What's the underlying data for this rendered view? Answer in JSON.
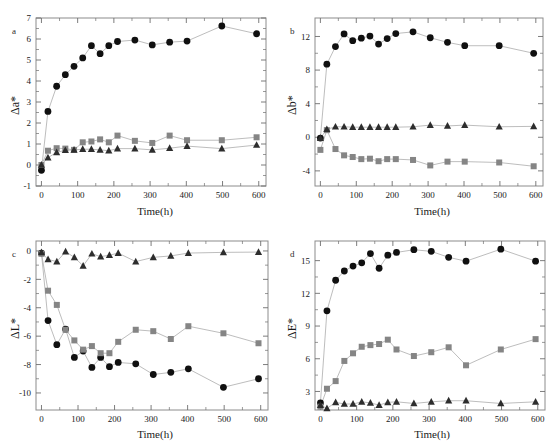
{
  "figure": {
    "title": "",
    "panel_count": 4
  },
  "chart_data": [
    {
      "panel": "a",
      "type": "line",
      "title": "a",
      "xlabel": "Time(h)",
      "ylabel": "Δa*",
      "xlim": [
        -15,
        620
      ],
      "ylim": [
        -1,
        7
      ],
      "xticks": [
        0,
        100,
        200,
        300,
        400,
        500,
        600
      ],
      "xticklabels": [
        "0",
        "100",
        "200",
        "300",
        "400",
        "500",
        "600"
      ],
      "yticks": [
        -1,
        0,
        1,
        2,
        3,
        4,
        5,
        6,
        7
      ],
      "yticklabels": [
        "-1",
        "0",
        "1",
        "2",
        "3",
        "4",
        "5",
        "6",
        "7"
      ],
      "grid": false,
      "legend": "none",
      "series": [
        {
          "name": "circles",
          "marker": "circle",
          "color": "#101010",
          "x": [
            0,
            18,
            42,
            66,
            90,
            114,
            138,
            162,
            186,
            210,
            258,
            306,
            354,
            402,
            498,
            594
          ],
          "y": [
            -0.25,
            2.55,
            3.75,
            4.3,
            4.7,
            5.1,
            5.68,
            5.3,
            5.68,
            5.88,
            5.95,
            5.72,
            5.85,
            5.9,
            6.62,
            6.25
          ]
        },
        {
          "name": "squares",
          "marker": "square",
          "color": "#858585",
          "x": [
            0,
            18,
            42,
            66,
            90,
            114,
            138,
            162,
            186,
            210,
            258,
            306,
            354,
            402,
            498,
            594
          ],
          "y": [
            0.0,
            0.68,
            0.8,
            0.78,
            0.72,
            1.08,
            1.12,
            1.22,
            1.08,
            1.4,
            1.15,
            1.05,
            1.4,
            1.18,
            1.18,
            1.32
          ]
        },
        {
          "name": "triangles",
          "marker": "triangle",
          "color": "#2d2d2d",
          "x": [
            0,
            18,
            42,
            66,
            90,
            114,
            138,
            162,
            186,
            210,
            258,
            306,
            354,
            402,
            498,
            594
          ],
          "y": [
            0.0,
            0.35,
            0.6,
            0.7,
            0.72,
            0.75,
            0.75,
            0.72,
            0.68,
            0.78,
            0.78,
            0.72,
            0.8,
            0.9,
            0.78,
            0.95
          ]
        }
      ]
    },
    {
      "panel": "b",
      "type": "line",
      "title": "b",
      "xlabel": "Time(h)",
      "ylabel": "Δb*",
      "xlim": [
        -15,
        620
      ],
      "ylim": [
        -5.8,
        14.2
      ],
      "xticks": [
        0,
        100,
        200,
        300,
        400,
        500,
        600
      ],
      "xticklabels": [
        "0",
        "100",
        "200",
        "300",
        "400",
        "500",
        "600"
      ],
      "yticks": [
        -4,
        0,
        4,
        8,
        12
      ],
      "yticklabels": [
        "-4",
        "0",
        "4",
        "8",
        "12"
      ],
      "grid": false,
      "legend": "none",
      "series": [
        {
          "name": "circles",
          "marker": "circle",
          "color": "#101010",
          "x": [
            0,
            18,
            42,
            66,
            90,
            114,
            138,
            162,
            186,
            210,
            258,
            306,
            354,
            402,
            498,
            594
          ],
          "y": [
            -0.1,
            8.7,
            10.8,
            12.3,
            11.5,
            11.8,
            12.05,
            11.1,
            11.75,
            12.35,
            12.55,
            11.85,
            11.3,
            10.9,
            10.9,
            10.0
          ]
        },
        {
          "name": "squares",
          "marker": "square",
          "color": "#858585",
          "x": [
            0,
            18,
            42,
            66,
            90,
            114,
            138,
            162,
            186,
            210,
            258,
            306,
            354,
            402,
            498,
            594
          ],
          "y": [
            -1.5,
            0.85,
            -1.4,
            -2.15,
            -2.35,
            -2.6,
            -2.55,
            -2.85,
            -2.6,
            -2.6,
            -2.7,
            -3.35,
            -2.9,
            -2.9,
            -3.0,
            -3.45
          ]
        },
        {
          "name": "triangles",
          "marker": "triangle",
          "color": "#2d2d2d",
          "x": [
            0,
            18,
            42,
            66,
            90,
            114,
            138,
            162,
            186,
            210,
            258,
            306,
            354,
            402,
            498,
            594
          ],
          "y": [
            -0.1,
            0.95,
            1.25,
            1.25,
            1.2,
            1.2,
            1.2,
            1.2,
            1.2,
            1.2,
            1.25,
            1.45,
            1.35,
            1.45,
            1.25,
            1.3
          ]
        }
      ]
    },
    {
      "panel": "c",
      "type": "line",
      "title": "c",
      "xlabel": "Time(h)",
      "ylabel": "ΔL*",
      "xlim": [
        -15,
        620
      ],
      "ylim": [
        -11.2,
        0.7
      ],
      "xticks": [
        0,
        100,
        200,
        300,
        400,
        500,
        600
      ],
      "xticklabels": [
        "0",
        "100",
        "200",
        "300",
        "400",
        "500",
        "600"
      ],
      "yticks": [
        0,
        -2,
        -4,
        -6,
        -8,
        -10
      ],
      "yticklabels": [
        "0",
        "-2",
        "-4",
        "-6",
        "-8",
        "-10"
      ],
      "grid": false,
      "legend": "none",
      "series": [
        {
          "name": "circles",
          "marker": "circle",
          "color": "#101010",
          "x": [
            0,
            18,
            42,
            66,
            90,
            114,
            138,
            162,
            186,
            210,
            258,
            306,
            354,
            402,
            498,
            594
          ],
          "y": [
            -0.15,
            -4.9,
            -6.6,
            -5.5,
            -7.5,
            -7.05,
            -8.2,
            -7.5,
            -8.15,
            -7.85,
            -7.95,
            -8.7,
            -8.55,
            -8.3,
            -9.6,
            -9.0
          ]
        },
        {
          "name": "squares",
          "marker": "square",
          "color": "#858585",
          "x": [
            0,
            18,
            42,
            66,
            90,
            114,
            138,
            162,
            186,
            210,
            258,
            306,
            354,
            402,
            498,
            594
          ],
          "y": [
            -0.2,
            -2.8,
            -3.8,
            -5.55,
            -6.3,
            -6.95,
            -6.7,
            -7.2,
            -7.2,
            -6.4,
            -5.55,
            -5.65,
            -6.2,
            -5.3,
            -5.8,
            -6.5
          ]
        },
        {
          "name": "triangles",
          "marker": "triangle",
          "color": "#2d2d2d",
          "x": [
            0,
            18,
            42,
            66,
            90,
            114,
            138,
            162,
            186,
            210,
            258,
            306,
            354,
            402,
            498,
            594
          ],
          "y": [
            -0.1,
            -0.6,
            -0.75,
            -0.05,
            -0.45,
            -1.05,
            -0.2,
            -0.4,
            -0.3,
            -0.15,
            -0.75,
            -0.45,
            -0.35,
            -0.15,
            -0.1,
            -0.08
          ]
        }
      ]
    },
    {
      "panel": "d",
      "type": "line",
      "title": "d",
      "xlabel": "Time(h)",
      "ylabel": "ΔE*",
      "xlim": [
        -15,
        620
      ],
      "ylim": [
        1.3,
        16.8
      ],
      "xticks": [
        0,
        100,
        200,
        300,
        400,
        500,
        600
      ],
      "xticklabels": [
        "0",
        "100",
        "200",
        "300",
        "400",
        "500",
        "600"
      ],
      "yticks": [
        3,
        6,
        9,
        12,
        15
      ],
      "yticklabels": [
        "3",
        "6",
        "9",
        "12",
        "15"
      ],
      "grid": false,
      "legend": "none",
      "series": [
        {
          "name": "circles",
          "marker": "circle",
          "color": "#101010",
          "x": [
            0,
            18,
            42,
            66,
            90,
            114,
            138,
            162,
            186,
            210,
            258,
            306,
            354,
            402,
            498,
            594
          ],
          "y": [
            1.95,
            10.4,
            13.2,
            14.05,
            14.5,
            14.8,
            15.65,
            14.3,
            15.5,
            15.75,
            16.0,
            15.85,
            15.3,
            14.95,
            16.05,
            14.95
          ]
        },
        {
          "name": "squares",
          "marker": "square",
          "color": "#858585",
          "x": [
            0,
            18,
            42,
            66,
            90,
            114,
            138,
            162,
            186,
            210,
            258,
            306,
            354,
            402,
            498,
            594
          ],
          "y": [
            1.6,
            3.25,
            3.95,
            5.8,
            6.5,
            7.1,
            7.25,
            7.35,
            7.75,
            6.85,
            6.25,
            6.6,
            7.05,
            5.4,
            6.85,
            7.8
          ]
        },
        {
          "name": "triangles",
          "marker": "triangle",
          "color": "#2d2d2d",
          "x": [
            0,
            18,
            42,
            66,
            90,
            114,
            138,
            162,
            186,
            210,
            258,
            306,
            354,
            402,
            498,
            594
          ],
          "y": [
            1.75,
            1.45,
            2.0,
            1.85,
            1.85,
            2.05,
            1.95,
            1.75,
            2.0,
            2.05,
            1.9,
            2.05,
            2.15,
            2.15,
            1.9,
            2.05
          ]
        }
      ]
    }
  ]
}
